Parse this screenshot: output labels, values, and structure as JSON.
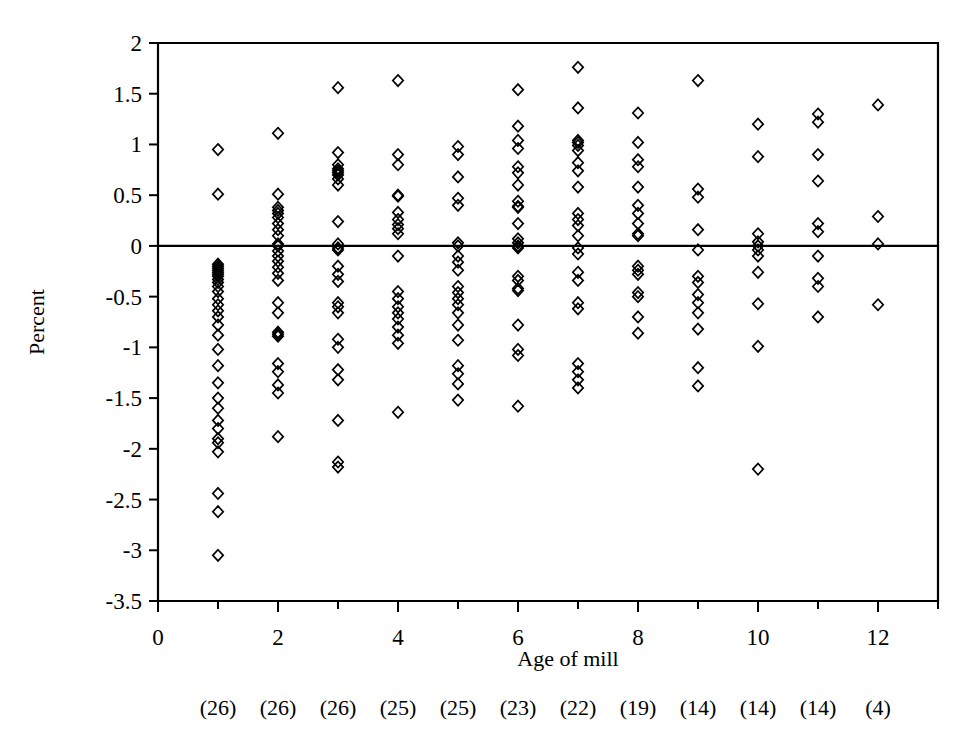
{
  "chart_data": {
    "type": "scatter",
    "title": "",
    "xlabel": "Age of mill",
    "ylabel": "Percent",
    "xlim": [
      0,
      13
    ],
    "ylim": [
      -3.5,
      2
    ],
    "ytick_step": 0.5,
    "xticks": [
      0,
      2,
      4,
      6,
      8,
      10,
      12
    ],
    "xtick_labels": [
      "0",
      "2",
      "4",
      "6",
      "8",
      "10",
      "12"
    ],
    "xminor_ticks": [
      1,
      3,
      5,
      7,
      9,
      11,
      13
    ],
    "yticks": [
      2,
      1.5,
      1,
      0.5,
      0,
      -0.5,
      -1,
      -1.5,
      -2,
      -2.5,
      -3,
      -3.5
    ],
    "ytick_labels": [
      "2",
      "1.5",
      "1",
      "0.5",
      "0",
      "-0.5",
      "-1",
      "-1.5",
      "-2",
      "-2.5",
      "-3",
      "-3.5"
    ],
    "grid": false,
    "legend": null,
    "reference_line_y": 0,
    "marker_style": "open-diamond",
    "marker_color": "#000000",
    "sample_size_labels": [
      "(26)",
      "(26)",
      "(26)",
      "(25)",
      "(25)",
      "(23)",
      "(22)",
      "(19)",
      "(14)",
      "(14)",
      "(14)",
      "(4)"
    ],
    "sample_sizes": [
      26,
      26,
      26,
      25,
      25,
      23,
      22,
      19,
      14,
      14,
      14,
      4
    ],
    "series": [
      {
        "name": "Age 1",
        "x": 1,
        "values": [
          0.95,
          0.51,
          -0.18,
          -0.2,
          -0.22,
          -0.24,
          -0.26,
          -0.28,
          -0.3,
          -0.33,
          -0.36,
          -0.4,
          -0.45,
          -0.52,
          -0.58,
          -0.64,
          -0.7,
          -0.78,
          -0.88,
          -1.02,
          -1.18,
          -1.35,
          -1.5,
          -1.6,
          -1.72,
          -1.8,
          -1.9,
          -1.94,
          -2.03,
          -2.44,
          -2.62,
          -3.05
        ]
      },
      {
        "name": "Age 2",
        "x": 2,
        "values": [
          1.11,
          0.51,
          0.38,
          0.35,
          0.32,
          0.28,
          0.22,
          0.16,
          0.1,
          0.02,
          0.0,
          -0.05,
          -0.1,
          -0.15,
          -0.21,
          -0.27,
          -0.34,
          -0.56,
          -0.66,
          -0.85,
          -0.87,
          -0.89,
          -1.16,
          -1.24,
          -1.37,
          -1.45,
          -1.88
        ]
      },
      {
        "name": "Age 3",
        "x": 3,
        "values": [
          1.56,
          0.92,
          0.8,
          0.76,
          0.74,
          0.72,
          0.7,
          0.66,
          0.6,
          0.24,
          0.02,
          -0.02,
          -0.04,
          -0.2,
          -0.28,
          -0.35,
          -0.56,
          -0.6,
          -0.66,
          -0.92,
          -1.0,
          -1.22,
          -1.32,
          -1.72,
          -2.13,
          -2.18
        ]
      },
      {
        "name": "Age 4",
        "x": 4,
        "values": [
          1.63,
          0.9,
          0.8,
          0.5,
          0.49,
          0.33,
          0.26,
          0.21,
          0.17,
          0.12,
          -0.1,
          -0.45,
          -0.52,
          -0.6,
          -0.66,
          -0.72,
          -0.8,
          -0.88,
          -0.96,
          -1.64
        ]
      },
      {
        "name": "Age 5",
        "x": 5,
        "values": [
          0.98,
          0.9,
          0.68,
          0.47,
          0.4,
          0.03,
          0.0,
          -0.1,
          -0.16,
          -0.24,
          -0.4,
          -0.46,
          -0.52,
          -0.58,
          -0.66,
          -0.78,
          -0.93,
          -1.18,
          -1.26,
          -1.36,
          -1.52
        ]
      },
      {
        "name": "Age 6",
        "x": 6,
        "values": [
          1.54,
          1.18,
          1.04,
          0.96,
          0.78,
          0.72,
          0.6,
          0.44,
          0.39,
          0.38,
          0.22,
          0.07,
          0.03,
          0.0,
          -0.02,
          -0.3,
          -0.34,
          -0.42,
          -0.44,
          -0.78,
          -1.02,
          -1.08,
          -1.58
        ]
      },
      {
        "name": "Age 7",
        "x": 7,
        "values": [
          1.76,
          1.36,
          1.04,
          1.02,
          0.99,
          0.94,
          0.82,
          0.74,
          0.58,
          0.32,
          0.26,
          0.2,
          0.1,
          -0.02,
          -0.08,
          -0.26,
          -0.34,
          -0.56,
          -0.62,
          -1.16,
          -1.24,
          -1.32,
          -1.4
        ]
      },
      {
        "name": "Age 8",
        "x": 8,
        "values": [
          1.31,
          1.02,
          0.85,
          0.78,
          0.58,
          0.4,
          0.32,
          0.22,
          0.12,
          0.1,
          -0.2,
          -0.24,
          -0.28,
          -0.46,
          -0.5,
          -0.7,
          -0.86
        ]
      },
      {
        "name": "Age 9",
        "x": 9,
        "values": [
          1.63,
          0.56,
          0.48,
          0.16,
          -0.04,
          -0.3,
          -0.36,
          -0.48,
          -0.56,
          -0.66,
          -0.82,
          -1.2,
          -1.38
        ]
      },
      {
        "name": "Age 10",
        "x": 10,
        "values": [
          1.2,
          0.88,
          0.12,
          0.04,
          0.0,
          -0.04,
          -0.1,
          -0.26,
          -0.57,
          -0.99,
          -2.2
        ]
      },
      {
        "name": "Age 11",
        "x": 11,
        "values": [
          1.3,
          1.22,
          0.9,
          0.64,
          0.22,
          0.14,
          -0.1,
          -0.32,
          -0.4,
          -0.7
        ]
      },
      {
        "name": "Age 12",
        "x": 12,
        "values": [
          1.39,
          0.29,
          0.02,
          -0.58
        ]
      }
    ]
  }
}
